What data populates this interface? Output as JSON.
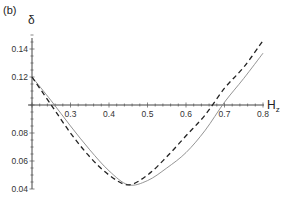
{
  "chart_data": {
    "type": "line",
    "panel_label": "(b)",
    "title": "",
    "xlabel": "H",
    "xlabel_subscript": "z",
    "ylabel": "δ",
    "xlim": [
      0.2,
      0.8
    ],
    "ylim": [
      0.04,
      0.15
    ],
    "x_axis_crossing_y": 0.1,
    "x_ticks": [
      0.3,
      0.4,
      0.5,
      0.6,
      0.7,
      0.8
    ],
    "x_tick_labels": [
      "0.3",
      "0.4",
      "0.5",
      "0.6",
      "0.7",
      "0.8"
    ],
    "y_ticks": [
      0.04,
      0.06,
      0.08,
      0.12,
      0.14
    ],
    "y_tick_labels": [
      "0.04",
      "0.06",
      "0.08",
      "0.12",
      "0.14"
    ],
    "grid": false,
    "legend": null,
    "x": [
      0.2,
      0.25,
      0.3,
      0.35,
      0.4,
      0.45,
      0.5,
      0.55,
      0.6,
      0.65,
      0.7,
      0.75,
      0.8
    ],
    "series": [
      {
        "name": "solid",
        "style": "solid",
        "color": "#888888",
        "values": [
          0.12,
          0.103,
          0.085,
          0.068,
          0.053,
          0.043,
          0.046,
          0.055,
          0.066,
          0.082,
          0.102,
          0.119,
          0.137
        ]
      },
      {
        "name": "dashed",
        "style": "dashed",
        "color": "#222222",
        "values": [
          0.12,
          0.1,
          0.08,
          0.063,
          0.05,
          0.043,
          0.05,
          0.063,
          0.078,
          0.093,
          0.112,
          0.127,
          0.146
        ]
      }
    ]
  }
}
